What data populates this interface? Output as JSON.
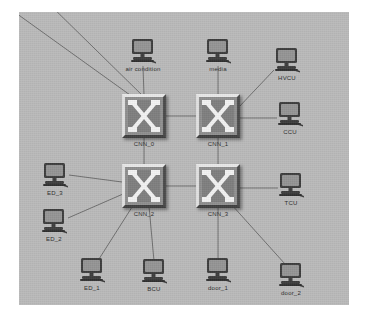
{
  "diagram": {
    "type": "network-topology",
    "canvas": {
      "background_color": "#b9b9b9",
      "page_background_color": "#ffffff",
      "link_color": "#6e6e6e",
      "label_color": "#2b2b2b"
    },
    "switches": [
      {
        "id": "cnn_0",
        "label": "CNN_0",
        "x": 125,
        "y": 104
      },
      {
        "id": "cnn_1",
        "label": "CNN_1",
        "x": 199,
        "y": 104
      },
      {
        "id": "cnn_2",
        "label": "CNN_2",
        "x": 125,
        "y": 174
      },
      {
        "id": "cnn_3",
        "label": "CNN_3",
        "x": 199,
        "y": 174
      }
    ],
    "endpoints": [
      {
        "id": "air_condition",
        "label": "air condition",
        "x": 124,
        "y": 42
      },
      {
        "id": "media",
        "label": "media",
        "x": 199,
        "y": 42
      },
      {
        "id": "hvcu",
        "label": "HVCU",
        "x": 268,
        "y": 51
      },
      {
        "id": "ccu",
        "label": "CCU",
        "x": 271,
        "y": 105
      },
      {
        "id": "tcu",
        "label": "TCU",
        "x": 272,
        "y": 176
      },
      {
        "id": "ed_3",
        "label": "ED_3",
        "x": 36,
        "y": 166
      },
      {
        "id": "ed_2",
        "label": "ED_2",
        "x": 35,
        "y": 212
      },
      {
        "id": "ed_1",
        "label": "ED_1",
        "x": 73,
        "y": 261
      },
      {
        "id": "bcu",
        "label": "BCU",
        "x": 135,
        "y": 262
      },
      {
        "id": "door_1",
        "label": "door_1",
        "x": 199,
        "y": 261
      },
      {
        "id": "door_2",
        "label": "door_2",
        "x": 272,
        "y": 266
      }
    ],
    "links": [
      {
        "from": "cnn_0",
        "to": "cnn_1"
      },
      {
        "from": "cnn_2",
        "to": "cnn_3"
      },
      {
        "from": "cnn_0",
        "to": "cnn_2"
      },
      {
        "from": "cnn_1",
        "to": "cnn_3"
      },
      {
        "from": "cnn_0",
        "to": "air_condition"
      },
      {
        "from": "cnn_1",
        "to": "media"
      },
      {
        "from": "cnn_1",
        "to": "hvcu"
      },
      {
        "from": "cnn_1",
        "to": "ccu"
      },
      {
        "from": "cnn_3",
        "to": "tcu"
      },
      {
        "from": "cnn_2",
        "to": "ed_3"
      },
      {
        "from": "cnn_2",
        "to": "ed_2"
      },
      {
        "from": "cnn_2",
        "to": "ed_1"
      },
      {
        "from": "cnn_2",
        "to": "bcu"
      },
      {
        "from": "cnn_3",
        "to": "door_1"
      },
      {
        "from": "cnn_3",
        "to": "door_2"
      },
      {
        "from": "cnn_0",
        "to": "offscreen_top_left_a"
      },
      {
        "from": "cnn_0",
        "to": "offscreen_top_left_b"
      }
    ]
  }
}
